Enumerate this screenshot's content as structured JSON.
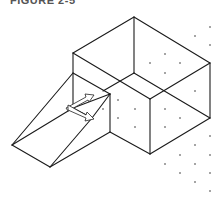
{
  "caption": {
    "text": "FIGURE 2-5"
  },
  "drawing": {
    "stroke_color": "#1a1a1a",
    "dot_color": "#333333",
    "box_edges": [
      [
        134,
        17,
        73,
        53
      ],
      [
        134,
        17,
        210,
        63
      ],
      [
        73,
        53,
        150,
        99
      ],
      [
        210,
        63,
        150,
        99
      ],
      [
        134,
        17,
        134,
        73
      ],
      [
        210,
        63,
        210,
        118
      ],
      [
        150,
        99,
        150,
        154
      ],
      [
        73,
        53,
        73,
        108
      ],
      [
        150,
        154,
        210,
        118
      ],
      [
        134,
        73,
        210,
        118
      ],
      [
        134,
        73,
        103,
        91
      ],
      [
        110,
        94,
        110,
        132
      ],
      [
        110,
        132,
        150,
        154
      ]
    ],
    "wedge_edges": [
      [
        73,
        73,
        110,
        94
      ],
      [
        73,
        73,
        12,
        145
      ],
      [
        12,
        145,
        50,
        167
      ],
      [
        12,
        145,
        73,
        108
      ],
      [
        73,
        108,
        110,
        94
      ],
      [
        50,
        167,
        110,
        132
      ],
      [
        50,
        167,
        92,
        118
      ],
      [
        92,
        118,
        110,
        94
      ],
      [
        73,
        108,
        92,
        118
      ]
    ],
    "grid_dots": [
      [
        210,
        27
      ],
      [
        195,
        36
      ],
      [
        210,
        45
      ],
      [
        165,
        54
      ],
      [
        150,
        63
      ],
      [
        180,
        63
      ],
      [
        165,
        73
      ],
      [
        195,
        91
      ],
      [
        118,
        100
      ],
      [
        103,
        109
      ],
      [
        135,
        109
      ],
      [
        165,
        109
      ],
      [
        118,
        118
      ],
      [
        180,
        118
      ],
      [
        135,
        127
      ],
      [
        165,
        127
      ],
      [
        210,
        136
      ],
      [
        195,
        145
      ],
      [
        180,
        155
      ],
      [
        210,
        155
      ],
      [
        165,
        164
      ],
      [
        195,
        164
      ],
      [
        180,
        173
      ],
      [
        210,
        173
      ],
      [
        195,
        182
      ],
      [
        210,
        191
      ]
    ],
    "ucs_icon": {
      "name": "ucs-icon",
      "origin": [
        73,
        108
      ],
      "x_arrow": {
        "from": [
          73,
          108
        ],
        "to": [
          93,
          96
        ]
      },
      "y_arrow": {
        "from": [
          73,
          108
        ],
        "to": [
          92,
          119
        ]
      }
    }
  }
}
